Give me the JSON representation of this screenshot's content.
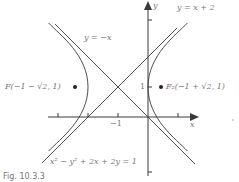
{
  "figure": {
    "caption": "Fig. 10.3.3",
    "equation": "x² − y² + 2x + 2y = 1",
    "axes": {
      "x_label": "x",
      "y_label": "y"
    },
    "ticks": {
      "x_label_minus1": "−1",
      "y_label_1": "1"
    },
    "asymptotes": [
      {
        "label": "y = −x"
      },
      {
        "label": "y = x + 2"
      }
    ],
    "foci": [
      {
        "label": "F(−1 − √2, 1)"
      },
      {
        "label": "F₂(−1 + √2, 1)"
      }
    ],
    "colors": {
      "ink": "#3a3a3a",
      "text": "#777777"
    }
  }
}
